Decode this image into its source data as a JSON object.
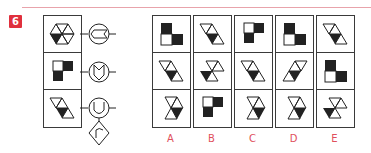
{
  "question": {
    "number": "6",
    "accent_color": "#e0303d",
    "line_color": "#e8a3ab"
  },
  "stem": {
    "cells": [
      {
        "figure": "hourglass-bowtie",
        "desc": "two triangle pairs meeting at a point, lower-left triangle filled black"
      },
      {
        "figure": "L-squares",
        "desc": "three squares: top-right black, bottom-left black, top-left white"
      },
      {
        "figure": "slanted-parallelogram",
        "desc": "triangles along diagonal, middle-lower triangle black"
      }
    ],
    "symbols": [
      {
        "name": "circle-with-arrow-notch",
        "desc": "circle containing a leftward chevron shape"
      },
      {
        "name": "circle-with-shield-m",
        "desc": "circle containing an M-shaped shield"
      },
      {
        "name": "circle-with-u",
        "desc": "circle containing a U shape"
      },
      {
        "name": "diamond-with-r",
        "desc": "diamond containing an r-like hook"
      }
    ]
  },
  "options": [
    {
      "label": "A",
      "cells": [
        "L-squares",
        "slanted-parallelogram",
        "hourglass-right"
      ]
    },
    {
      "label": "B",
      "cells": [
        "slanted-parallelogram",
        "hourglass-bowtie",
        "L-squares"
      ]
    },
    {
      "label": "C",
      "cells": [
        "L-squares",
        "slanted-parallelogram",
        "hourglass-right"
      ]
    },
    {
      "label": "D",
      "cells": [
        "L-squares",
        "slanted-parallelogram-left",
        "hourglass-right"
      ]
    },
    {
      "label": "E",
      "cells": [
        "slanted-parallelogram",
        "L-squares",
        "hourglass-bowtie"
      ]
    }
  ]
}
